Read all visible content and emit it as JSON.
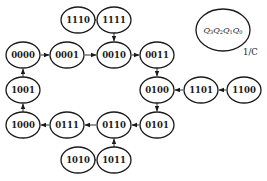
{
  "diagram": {
    "type": "state-transition-diagram",
    "legend": {
      "state_format": [
        "Q3",
        "Q2",
        "Q1",
        "Q0"
      ],
      "io_label": "1/C"
    },
    "nodes": [
      {
        "id": "1110",
        "label": "1110",
        "x": 78,
        "y": 20
      },
      {
        "id": "1111",
        "label": "1111",
        "x": 114,
        "y": 20
      },
      {
        "id": "0000",
        "label": "0000",
        "x": 23,
        "y": 55
      },
      {
        "id": "0001",
        "label": "0001",
        "x": 67,
        "y": 55
      },
      {
        "id": "0010",
        "label": "0010",
        "x": 114,
        "y": 55
      },
      {
        "id": "0011",
        "label": "0011",
        "x": 157,
        "y": 55
      },
      {
        "id": "1001",
        "label": "1001",
        "x": 23,
        "y": 90
      },
      {
        "id": "0100",
        "label": "0100",
        "x": 157,
        "y": 90
      },
      {
        "id": "1101",
        "label": "1101",
        "x": 201,
        "y": 90
      },
      {
        "id": "1100",
        "label": "1100",
        "x": 244,
        "y": 90
      },
      {
        "id": "1000",
        "label": "1000",
        "x": 23,
        "y": 125
      },
      {
        "id": "0111",
        "label": "0111",
        "x": 67,
        "y": 125
      },
      {
        "id": "0110",
        "label": "0110",
        "x": 114,
        "y": 125
      },
      {
        "id": "0101",
        "label": "0101",
        "x": 157,
        "y": 125
      },
      {
        "id": "1010",
        "label": "1010",
        "x": 78,
        "y": 160
      },
      {
        "id": "1011",
        "label": "1011",
        "x": 114,
        "y": 160
      }
    ],
    "edges": [
      {
        "from": "1110",
        "to": "1111"
      },
      {
        "from": "1111",
        "to": "0010"
      },
      {
        "from": "0000",
        "to": "0001"
      },
      {
        "from": "0001",
        "to": "0010"
      },
      {
        "from": "0010",
        "to": "0011"
      },
      {
        "from": "0011",
        "to": "0100"
      },
      {
        "from": "1100",
        "to": "1101"
      },
      {
        "from": "1101",
        "to": "0100"
      },
      {
        "from": "0100",
        "to": "0101"
      },
      {
        "from": "0101",
        "to": "0110"
      },
      {
        "from": "1010",
        "to": "1011"
      },
      {
        "from": "1011",
        "to": "0110"
      },
      {
        "from": "0110",
        "to": "0111"
      },
      {
        "from": "0111",
        "to": "1000"
      },
      {
        "from": "1000",
        "to": "1001"
      },
      {
        "from": "1001",
        "to": "0000"
      }
    ]
  },
  "labels": {
    "n1110": "1110",
    "n1111": "1111",
    "n0000": "0000",
    "n0001": "0001",
    "n0010": "0010",
    "n0011": "0011",
    "n1001": "1001",
    "n0100": "0100",
    "n1101": "1101",
    "n1100": "1100",
    "n1000": "1000",
    "n0111": "0111",
    "n0110": "0110",
    "n0101": "0101",
    "n1010": "1010",
    "n1011": "1011",
    "legend_q": "Q",
    "legend_s3": "3",
    "legend_s2": "2",
    "legend_s1": "1",
    "legend_s0": "0",
    "io": "1/C"
  }
}
